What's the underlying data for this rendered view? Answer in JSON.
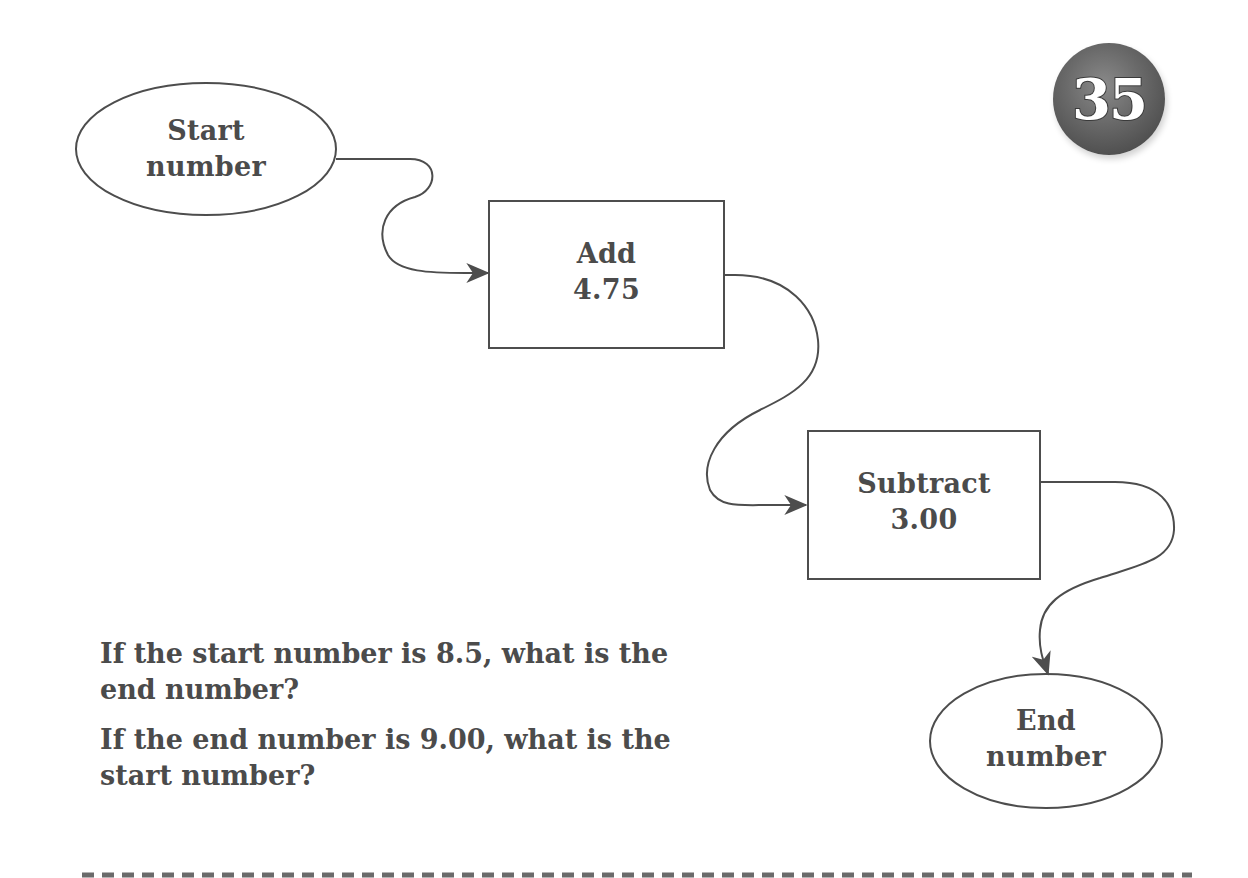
{
  "badge": {
    "number": "35"
  },
  "flowchart": {
    "start": {
      "line1": "Start",
      "line2": "number"
    },
    "step1": {
      "line1": "Add",
      "line2": "4.75"
    },
    "step2": {
      "line1": "Subtract",
      "line2": "3.00"
    },
    "end": {
      "line1": "End",
      "line2": "number"
    }
  },
  "questions": [
    {
      "line1": "If the start number is 8.5, what is the",
      "line2": "end number?"
    },
    {
      "line1": "If the end number is 9.00, what is the",
      "line2": "start number?"
    }
  ],
  "colors": {
    "stroke": "#4d4d4d",
    "text": "#4b4b4b",
    "badge": "#5a5a5a"
  }
}
